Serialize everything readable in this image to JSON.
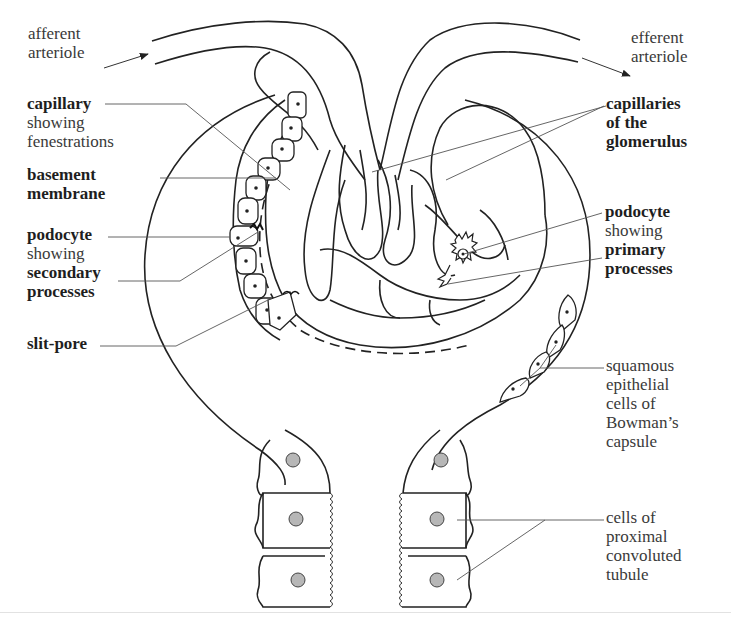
{
  "diagram": {
    "colors": {
      "line": "#222222",
      "text": "#3a3a3a",
      "bold_text": "#1e1e1e",
      "nucleus_fill": "#b7b7b7",
      "background": "#ffffff"
    }
  },
  "labels": {
    "afferent": {
      "line1": "afferent",
      "line2": "arteriole"
    },
    "efferent": {
      "line1": "efferent",
      "line2": "arteriole"
    },
    "capillary": {
      "line1": "capillary",
      "line2": "showing",
      "line3": "fenestrations"
    },
    "basement": {
      "line1": "basement",
      "line2": "membrane"
    },
    "podocyte_secondary": {
      "line1": "podocyte",
      "line2": "showing",
      "line3": "secondary",
      "line4": "processes"
    },
    "slit_pore": {
      "line1": "slit-pore"
    },
    "capillaries_glomerulus": {
      "line1": "capillaries",
      "line2": "of the",
      "line3": "glomerulus"
    },
    "podocyte_primary": {
      "line1": "podocyte",
      "line2": "showing",
      "line3": "primary",
      "line4": "processes"
    },
    "squamous": {
      "line1": "squamous",
      "line2": "epithelial",
      "line3": "cells of",
      "line4": "Bowman’s",
      "line5": "capsule"
    },
    "pct": {
      "line1": "cells of",
      "line2": "proximal",
      "line3": "convoluted",
      "line4": "tubule"
    }
  }
}
